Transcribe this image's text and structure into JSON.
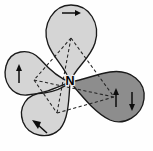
{
  "figure": {
    "title": "sp3 hybrid orbitals of nitrogen with electron spins",
    "center_atom_label": "N",
    "background_color": "#fefefe",
    "outline_color": "#1a1a1a",
    "dash_color": "#242424",
    "arrow_color": "#0d0d0d",
    "lobe_light_color": "#d5d5d5",
    "lobe_dark_color": "#8d8d8d",
    "center_point": {
      "x": 70,
      "y": 82
    },
    "lobes": [
      {
        "id": "lobe-top",
        "name": "top-lobe",
        "shade": "light",
        "fill": "#d5d5d5",
        "direction": "up",
        "tip": {
          "x": 70,
          "y": 82
        },
        "bulb_center": {
          "x": 71,
          "y": 28
        },
        "bulb_radius": 25,
        "arrows": [
          {
            "id": "arrow-top",
            "orientation": "right",
            "x1": 62,
            "y1": 13,
            "x2": 79,
            "y2": 13
          }
        ]
      },
      {
        "id": "lobe-left",
        "name": "left-lobe",
        "shade": "light",
        "fill": "#d5d5d5",
        "direction": "upper-left",
        "tip": {
          "x": 70,
          "y": 82
        },
        "bulb_center": {
          "x": 27,
          "y": 74
        },
        "bulb_radius": 21,
        "arrows": [
          {
            "id": "arrow-left",
            "orientation": "up",
            "x1": 19,
            "y1": 83,
            "x2": 19,
            "y2": 66
          }
        ]
      },
      {
        "id": "lobe-bottom-left",
        "name": "bottom-left-lobe",
        "shade": "light",
        "fill": "#d5d5d5",
        "direction": "down-left",
        "tip": {
          "x": 70,
          "y": 82
        },
        "bulb_center": {
          "x": 45,
          "y": 110
        },
        "bulb_radius": 24,
        "arrows": [
          {
            "id": "arrow-bottom-left",
            "orientation": "up-left",
            "x1": 47,
            "y1": 133,
            "x2": 34,
            "y2": 122
          }
        ]
      },
      {
        "id": "lobe-right",
        "name": "right-lobe",
        "shade": "dark",
        "fill": "#8d8d8d",
        "direction": "right",
        "tip": {
          "x": 70,
          "y": 82
        },
        "bulb_center": {
          "x": 117,
          "y": 98
        },
        "bulb_radius": 26,
        "arrows": [
          {
            "id": "arrow-right-up",
            "orientation": "up",
            "x1": 116,
            "y1": 107,
            "x2": 116,
            "y2": 90
          },
          {
            "id": "arrow-right-down",
            "orientation": "down",
            "x1": 132,
            "y1": 92,
            "x2": 132,
            "y2": 109
          }
        ]
      }
    ],
    "tetrahedron": {
      "name": "dashed-tetrahedron",
      "vertices": [
        {
          "id": "v-top",
          "x": 71,
          "y": 38
        },
        {
          "id": "v-left",
          "x": 34,
          "y": 80
        },
        {
          "id": "v-bottom",
          "x": 57,
          "y": 113
        },
        {
          "id": "v-right",
          "x": 114,
          "y": 97
        }
      ],
      "edges": [
        [
          "v-top",
          "v-left"
        ],
        [
          "v-top",
          "v-bottom"
        ],
        [
          "v-top",
          "v-right"
        ],
        [
          "v-left",
          "v-bottom"
        ],
        [
          "v-left",
          "v-right"
        ],
        [
          "v-bottom",
          "v-right"
        ]
      ]
    }
  }
}
